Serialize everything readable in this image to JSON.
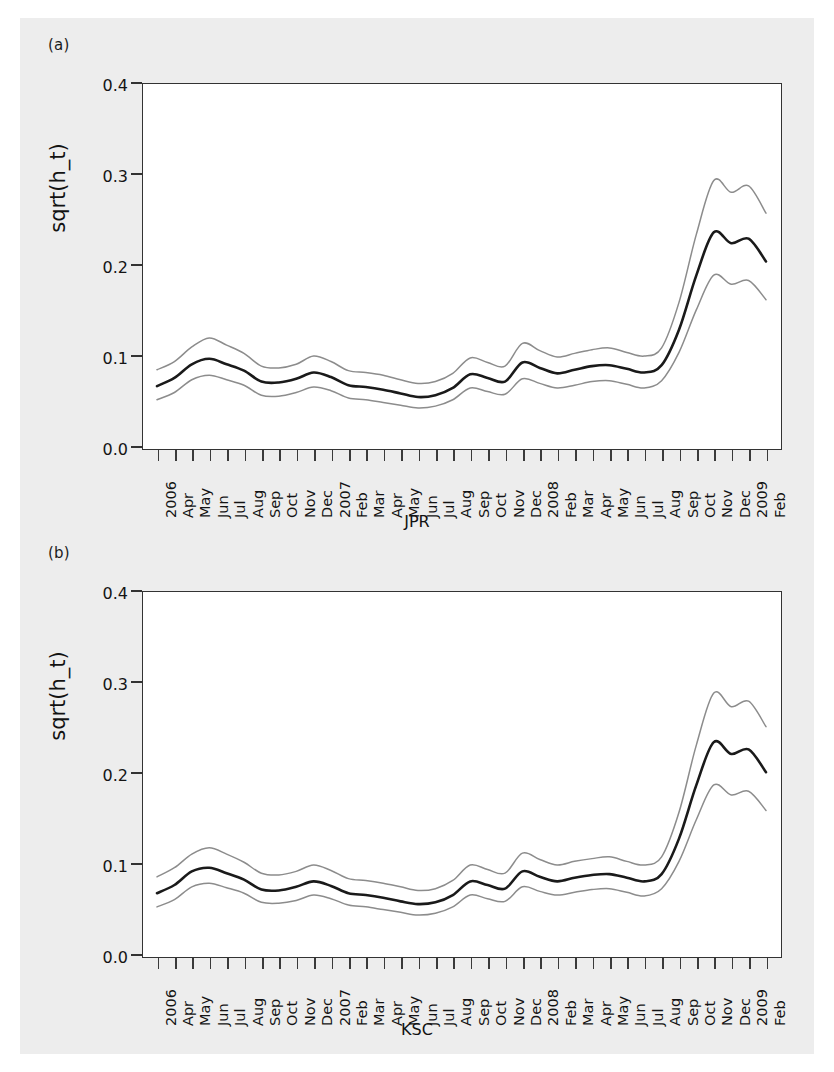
{
  "figure": {
    "background_color": "#ededed",
    "panels": [
      {
        "tag": "(a)",
        "ylabel": "sqrt(h_t)",
        "xtitle": "JPR"
      },
      {
        "tag": "(b)",
        "ylabel": "sqrt(h_t)",
        "xtitle": "KSC"
      }
    ]
  },
  "axes": {
    "y_ticks": [
      "0.0",
      "0.1",
      "0.2",
      "0.3",
      "0.4"
    ],
    "x_ticks": [
      "2006",
      "Apr",
      "May",
      "Jun",
      "Jul",
      "Aug",
      "Sep",
      "Oct",
      "Nov",
      "Dec",
      "2007",
      "Feb",
      "Mar",
      "Apr",
      "May",
      "Jun",
      "Jul",
      "Aug",
      "Sep",
      "Oct",
      "Nov",
      "Dec",
      "2008",
      "Feb",
      "Mar",
      "Apr",
      "May",
      "Jun",
      "Jul",
      "Aug",
      "Sep",
      "Oct",
      "Nov",
      "Dec",
      "2009",
      "Feb"
    ]
  },
  "colors": {
    "center_line": "#1a1a1a",
    "band_line": "#8c8c8c",
    "axis": "#333333",
    "plot_background": "#ffffff"
  },
  "chart_data": [
    {
      "type": "line",
      "title": "(a)",
      "xlabel": "JPR",
      "ylabel": "sqrt(h_t)",
      "ylim": [
        0.0,
        0.4
      ],
      "grid": false,
      "legend": "none",
      "x": [
        "2006-03",
        "2006-04",
        "2006-05",
        "2006-06",
        "2006-07",
        "2006-08",
        "2006-09",
        "2006-10",
        "2006-11",
        "2006-12",
        "2007-01",
        "2007-02",
        "2007-03",
        "2007-04",
        "2007-05",
        "2007-06",
        "2007-07",
        "2007-08",
        "2007-09",
        "2007-10",
        "2007-11",
        "2007-12",
        "2008-01",
        "2008-02",
        "2008-03",
        "2008-04",
        "2008-05",
        "2008-06",
        "2008-07",
        "2008-08",
        "2008-09",
        "2008-10",
        "2008-11",
        "2008-12",
        "2009-01",
        "2009-02"
      ],
      "series": [
        {
          "name": "upper band",
          "values": [
            0.086,
            0.095,
            0.111,
            0.121,
            0.113,
            0.104,
            0.09,
            0.088,
            0.092,
            0.101,
            0.095,
            0.085,
            0.083,
            0.08,
            0.075,
            0.071,
            0.073,
            0.082,
            0.099,
            0.094,
            0.09,
            0.115,
            0.107,
            0.1,
            0.104,
            0.108,
            0.11,
            0.105,
            0.101,
            0.11,
            0.16,
            0.235,
            0.294,
            0.281,
            0.288,
            0.258
          ]
        },
        {
          "name": "median",
          "values": [
            0.068,
            0.077,
            0.092,
            0.098,
            0.092,
            0.085,
            0.073,
            0.072,
            0.076,
            0.083,
            0.078,
            0.069,
            0.067,
            0.064,
            0.06,
            0.056,
            0.058,
            0.066,
            0.081,
            0.077,
            0.073,
            0.094,
            0.088,
            0.082,
            0.086,
            0.09,
            0.091,
            0.087,
            0.083,
            0.091,
            0.13,
            0.19,
            0.237,
            0.225,
            0.23,
            0.205
          ]
        },
        {
          "name": "lower band",
          "values": [
            0.053,
            0.061,
            0.075,
            0.08,
            0.075,
            0.069,
            0.058,
            0.057,
            0.061,
            0.067,
            0.063,
            0.055,
            0.053,
            0.05,
            0.047,
            0.044,
            0.046,
            0.053,
            0.066,
            0.062,
            0.059,
            0.076,
            0.071,
            0.066,
            0.069,
            0.073,
            0.074,
            0.07,
            0.066,
            0.074,
            0.105,
            0.152,
            0.19,
            0.18,
            0.184,
            0.163
          ]
        }
      ]
    },
    {
      "type": "line",
      "title": "(b)",
      "xlabel": "KSC",
      "ylabel": "sqrt(h_t)",
      "ylim": [
        0.0,
        0.4
      ],
      "grid": false,
      "legend": "none",
      "x": [
        "2006-03",
        "2006-04",
        "2006-05",
        "2006-06",
        "2006-07",
        "2006-08",
        "2006-09",
        "2006-10",
        "2006-11",
        "2006-12",
        "2007-01",
        "2007-02",
        "2007-03",
        "2007-04",
        "2007-05",
        "2007-06",
        "2007-07",
        "2007-08",
        "2007-09",
        "2007-10",
        "2007-11",
        "2007-12",
        "2008-01",
        "2008-02",
        "2008-03",
        "2008-04",
        "2008-05",
        "2008-06",
        "2008-07",
        "2008-08",
        "2008-09",
        "2008-10",
        "2008-11",
        "2008-12",
        "2009-01",
        "2009-02"
      ],
      "series": [
        {
          "name": "upper band",
          "values": [
            0.087,
            0.097,
            0.112,
            0.119,
            0.112,
            0.103,
            0.091,
            0.089,
            0.093,
            0.1,
            0.094,
            0.085,
            0.083,
            0.08,
            0.076,
            0.072,
            0.074,
            0.083,
            0.1,
            0.095,
            0.091,
            0.113,
            0.106,
            0.1,
            0.104,
            0.107,
            0.109,
            0.104,
            0.1,
            0.109,
            0.158,
            0.232,
            0.289,
            0.274,
            0.28,
            0.252
          ]
        },
        {
          "name": "median",
          "values": [
            0.069,
            0.078,
            0.093,
            0.097,
            0.091,
            0.084,
            0.073,
            0.072,
            0.076,
            0.082,
            0.077,
            0.069,
            0.067,
            0.064,
            0.06,
            0.057,
            0.059,
            0.067,
            0.082,
            0.078,
            0.074,
            0.093,
            0.087,
            0.082,
            0.086,
            0.089,
            0.09,
            0.086,
            0.082,
            0.09,
            0.129,
            0.188,
            0.235,
            0.222,
            0.227,
            0.202
          ]
        },
        {
          "name": "lower band",
          "values": [
            0.054,
            0.062,
            0.076,
            0.08,
            0.075,
            0.069,
            0.059,
            0.058,
            0.061,
            0.067,
            0.063,
            0.056,
            0.054,
            0.051,
            0.048,
            0.045,
            0.047,
            0.054,
            0.067,
            0.063,
            0.06,
            0.076,
            0.071,
            0.067,
            0.07,
            0.073,
            0.074,
            0.07,
            0.066,
            0.074,
            0.104,
            0.15,
            0.188,
            0.177,
            0.181,
            0.16
          ]
        }
      ]
    }
  ]
}
